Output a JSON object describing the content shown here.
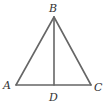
{
  "diagram": {
    "type": "geometry-triangle",
    "stroke_color": "#666666",
    "label_color": "#333333",
    "points": {
      "A": {
        "label": "A",
        "x": 16,
        "y": 85
      },
      "B": {
        "label": "B",
        "x": 54,
        "y": 17
      },
      "C": {
        "label": "C",
        "x": 91,
        "y": 85
      },
      "D": {
        "label": "D",
        "x": 54,
        "y": 85
      }
    },
    "segments": [
      "AB",
      "BC",
      "AC",
      "BD"
    ]
  }
}
